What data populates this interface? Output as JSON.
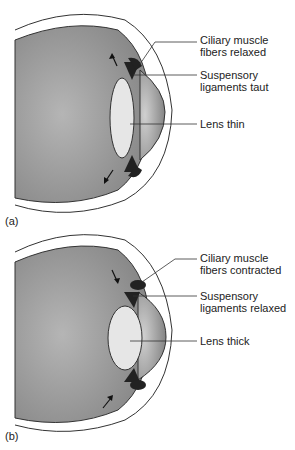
{
  "figure": {
    "panels": [
      {
        "id": "a",
        "panel_label": "(a)",
        "labels": {
          "ciliary": [
            "Ciliary muscle",
            "fibers relaxed"
          ],
          "ligaments": [
            "Suspensory",
            "ligaments taut"
          ],
          "lens": "Lens thin"
        }
      },
      {
        "id": "b",
        "panel_label": "(b)",
        "labels": {
          "ciliary": [
            "Ciliary muscle",
            "fibers contracted"
          ],
          "ligaments": [
            "Suspensory",
            "ligaments relaxed"
          ],
          "lens": "Lens thick"
        }
      }
    ],
    "colors": {
      "eyeball": "#8f8f8f",
      "lens": "#e6e6e6",
      "cornea": "#9a9a9a",
      "muscle": "#222222",
      "outline": "#333333"
    }
  }
}
